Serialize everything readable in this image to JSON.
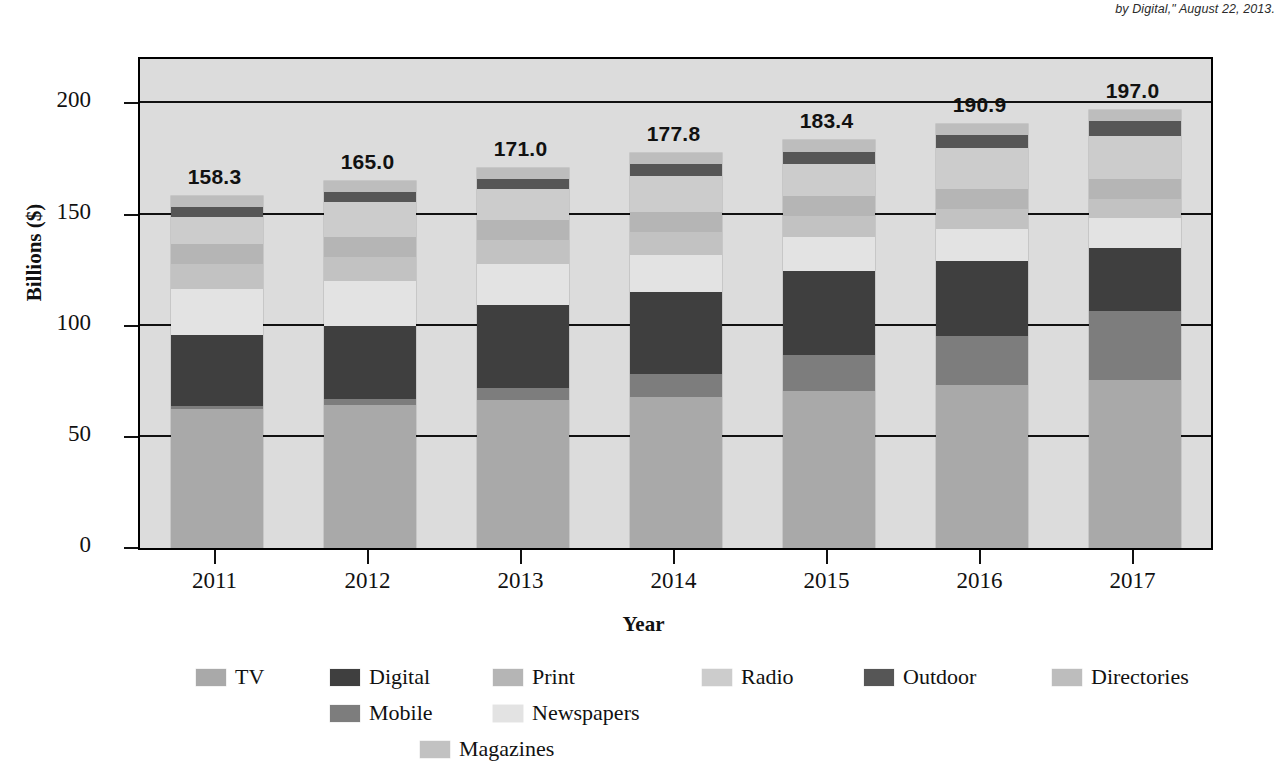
{
  "source_note": "by Digital,\" August 22, 2013.",
  "axes": {
    "ylabel": "Billions ($)",
    "xlabel": "Year",
    "yticks": [
      "0",
      "50",
      "100",
      "150",
      "200"
    ],
    "xticks": [
      "2011",
      "2012",
      "2013",
      "2014",
      "2015",
      "2016",
      "2017"
    ]
  },
  "chart_data": {
    "type": "bar",
    "title": "",
    "subtitle": "",
    "xlabel": "Year",
    "ylabel": "Billions ($)",
    "ylim": [
      0,
      220
    ],
    "ytick_values": [
      0,
      50,
      100,
      150,
      200
    ],
    "grid": true,
    "stacked": true,
    "legend_position": "bottom",
    "categories": [
      "2011",
      "2012",
      "2013",
      "2014",
      "2015",
      "2016",
      "2017"
    ],
    "totals": [
      "158.3",
      "165.0",
      "171.0",
      "177.8",
      "183.4",
      "190.9",
      "197.0"
    ],
    "totals_numeric": [
      158.3,
      165.0,
      171.0,
      177.8,
      183.4,
      190.9,
      197.0
    ],
    "series": [
      {
        "name": "TV",
        "color": "#a9a9a9",
        "values": [
          62.5,
          64.5,
          66.5,
          68.0,
          70.5,
          73.5,
          75.5
        ]
      },
      {
        "name": "Mobile",
        "color": "#7d7d7d",
        "values": [
          1.5,
          2.5,
          5.5,
          10.5,
          16.5,
          22.0,
          31.0
        ]
      },
      {
        "name": "Digital",
        "color": "#3f3f3f",
        "values": [
          32.0,
          33.0,
          37.5,
          36.5,
          37.5,
          33.5,
          28.5
        ]
      },
      {
        "name": "Newspapers",
        "color": "#e3e3e3",
        "values": [
          20.5,
          20.0,
          18.5,
          17.0,
          15.5,
          14.5,
          13.5
        ]
      },
      {
        "name": "Magazines",
        "color": "#c2c2c2",
        "values": [
          11.5,
          11.0,
          10.5,
          10.0,
          9.5,
          9.0,
          8.5
        ]
      },
      {
        "name": "Print",
        "color": "#b5b5b5",
        "values": [
          9.0,
          9.0,
          9.0,
          9.0,
          9.0,
          9.0,
          9.0
        ]
      },
      {
        "name": "Radio",
        "color": "#cccccc",
        "values": [
          12.0,
          15.5,
          14.0,
          16.5,
          14.5,
          18.5,
          19.5
        ]
      },
      {
        "name": "Outdoor",
        "color": "#565656",
        "values": [
          4.3,
          4.5,
          4.5,
          5.3,
          5.4,
          5.9,
          6.5
        ]
      },
      {
        "name": "Directories",
        "color": "#bdbdbd",
        "values": [
          5.0,
          5.0,
          5.0,
          5.0,
          5.0,
          5.0,
          5.0
        ]
      }
    ]
  },
  "legend": {
    "items": [
      {
        "label": "TV",
        "color": "#a9a9a9"
      },
      {
        "label": "Digital",
        "color": "#3f3f3f"
      },
      {
        "label": "Print",
        "color": "#b5b5b5"
      },
      {
        "label": "Radio",
        "color": "#cccccc"
      },
      {
        "label": "Outdoor",
        "color": "#565656"
      },
      {
        "label": "Directories",
        "color": "#bdbdbd"
      },
      {
        "label": "Mobile",
        "color": "#7d7d7d"
      },
      {
        "label": "Newspapers",
        "color": "#e3e3e3"
      },
      {
        "label": "Magazines",
        "color": "#c2c2c2"
      }
    ]
  }
}
